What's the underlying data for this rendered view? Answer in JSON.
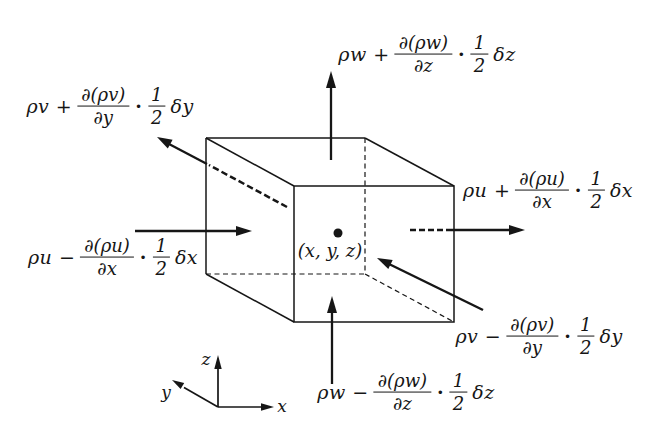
{
  "flux_labels": {
    "w_plus": {
      "prefix": "ρw +",
      "frac_num": "∂(ρw)",
      "frac_den": "∂z",
      "half_num": "1",
      "half_den": "2",
      "suffix": "δz"
    },
    "v_plus": {
      "prefix": "ρv +",
      "frac_num": "∂(ρv)",
      "frac_den": "∂y",
      "half_num": "1",
      "half_den": "2",
      "suffix": "δy"
    },
    "u_plus": {
      "prefix": "ρu +",
      "frac_num": "∂(ρu)",
      "frac_den": "∂x",
      "half_num": "1",
      "half_den": "2",
      "suffix": "δx"
    },
    "u_minus": {
      "prefix": "ρu −",
      "frac_num": "∂(ρu)",
      "frac_den": "∂x",
      "half_num": "1",
      "half_den": "2",
      "suffix": "δx"
    },
    "v_minus": {
      "prefix": "ρv −",
      "frac_num": "∂(ρv)",
      "frac_den": "∂y",
      "half_num": "1",
      "half_den": "2",
      "suffix": "δy"
    },
    "w_minus": {
      "prefix": "ρw −",
      "frac_num": "∂(ρw)",
      "frac_den": "∂z",
      "half_num": "1",
      "half_den": "2",
      "suffix": "δz"
    }
  },
  "symbols": {
    "cdot": "·"
  },
  "center_label": "(x, y, z)",
  "axes": {
    "x": "x",
    "y": "y",
    "z": "z"
  },
  "colors": {
    "ink": "#161616",
    "background": "#ffffff"
  }
}
